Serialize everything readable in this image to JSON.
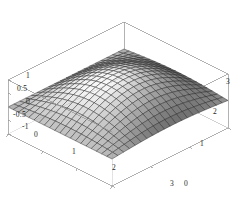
{
  "figure": {
    "kind": "surface-plot-3d",
    "background_color": "#ffffff",
    "frame_color": "#9a9a9a",
    "mesh_color": "#1a1a1a",
    "label_color": "#262626"
  },
  "chart_data": {
    "type": "surface",
    "title": "",
    "xlabel": "",
    "ylabel": "",
    "zlabel": "",
    "function": "sin(x)*sin(y)",
    "xlim": [
      0,
      3
    ],
    "ylim": [
      0,
      3
    ],
    "zlim": [
      -1,
      1
    ],
    "grid": true,
    "legend": "none",
    "shading": "grayscale",
    "mesh_divisions": 20,
    "x_ticks": [
      0,
      1,
      2,
      3
    ],
    "x_tick_labels": [
      "0",
      "1",
      "2",
      "3"
    ],
    "y_ticks": [
      0,
      1,
      2,
      3
    ],
    "y_tick_labels": [
      "0",
      "1",
      "2",
      "3"
    ],
    "z_ticks": [
      -1,
      -0.5,
      0,
      0.5,
      1
    ],
    "z_tick_labels": [
      "-1",
      "-0.5",
      "0",
      "0.5",
      "1"
    ],
    "view": {
      "azimuth_deg": 38,
      "elevation_deg": 26,
      "projection": "orthographic"
    },
    "x": [
      0,
      0.15,
      0.3,
      0.45,
      0.6,
      0.75,
      0.9,
      1.05,
      1.2,
      1.35,
      1.5,
      1.65,
      1.8,
      1.95,
      2.1,
      2.25,
      2.4,
      2.55,
      2.7,
      2.85,
      3
    ],
    "y": [
      0,
      0.15,
      0.3,
      0.45,
      0.6,
      0.75,
      0.9,
      1.05,
      1.2,
      1.35,
      1.5,
      1.65,
      1.8,
      1.95,
      2.1,
      2.25,
      2.4,
      2.55,
      2.7,
      2.85,
      3
    ],
    "z_corner_values": {
      "x0_y0": 0.0,
      "x3_y0": 0.0,
      "x0_y3": 0.0,
      "x3_y3": 0.02,
      "peak": 1.0,
      "valley": -1.0
    }
  },
  "axis_labels": {
    "z": [
      {
        "text": "1",
        "left": 26,
        "top": 72
      },
      {
        "text": "0.5",
        "left": 17,
        "top": 85
      },
      {
        "text": "0",
        "left": 26,
        "top": 98
      },
      {
        "text": "-0.5",
        "left": 13,
        "top": 111
      },
      {
        "text": "-1",
        "left": 22,
        "top": 123
      }
    ],
    "x_front": [
      {
        "text": "0",
        "left": 34,
        "top": 131
      },
      {
        "text": "1",
        "left": 72,
        "top": 148
      },
      {
        "text": "2",
        "left": 112,
        "top": 164
      },
      {
        "text": "3",
        "left": 170,
        "top": 180
      }
    ],
    "y_right": [
      {
        "text": "0",
        "left": 184,
        "top": 180
      },
      {
        "text": "1",
        "left": 200,
        "top": 140
      },
      {
        "text": "2",
        "left": 213,
        "top": 108
      },
      {
        "text": "3",
        "left": 226,
        "top": 78
      }
    ]
  }
}
